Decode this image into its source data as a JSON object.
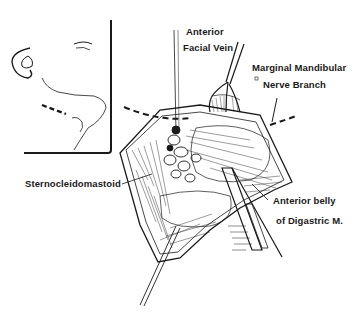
{
  "figure": {
    "inset": {
      "subject": "face-profile-with-incision-line"
    },
    "labels": {
      "anterior_facial_vein_line1": "Anterior",
      "anterior_facial_vein_line2": "Facial Vein",
      "marginal_mandibular_line1": "Marginal Mandibular",
      "marginal_mandibular_line2": "Nerve Branch",
      "sternocleidomastoid": "Sternocleidomastoid",
      "digastric_line1": "Anterior belly",
      "digastric_line2": "of Digastric M."
    },
    "colors": {
      "ink": "#1a1a1a",
      "background": "#ffffff"
    }
  }
}
